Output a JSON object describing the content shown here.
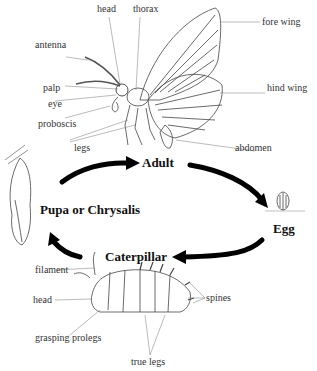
{
  "diagram": {
    "stages": {
      "adult": "Adult",
      "egg": "Egg",
      "caterpillar": "Caterpillar",
      "pupa": "Pupa or Chrysalis"
    },
    "adult_labels": {
      "head": "head",
      "thorax": "thorax",
      "fore_wing": "fore wing",
      "antenna": "antenna",
      "hind_wing": "hind wing",
      "palp": "palp",
      "eye": "eye",
      "proboscis": "proboscis",
      "legs": "legs",
      "abdomen": "abdomen"
    },
    "caterpillar_labels": {
      "filament": "filament",
      "head": "head",
      "spines": "spines",
      "grasping_prolegs": "grasping prolegs",
      "true_legs": "true legs"
    },
    "colors": {
      "line": "#333333",
      "arrow": "#000000",
      "background": "#ffffff"
    }
  }
}
